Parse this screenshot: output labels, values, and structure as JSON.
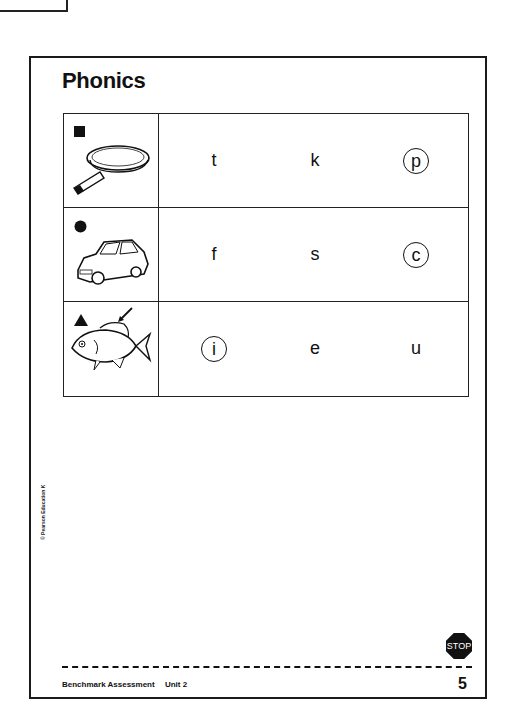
{
  "title": "Phonics",
  "rows": [
    {
      "marker": "square",
      "picture": "frying-pan",
      "choices": [
        {
          "letter": "t",
          "circled": false
        },
        {
          "letter": "k",
          "circled": false
        },
        {
          "letter": "p",
          "circled": true
        }
      ]
    },
    {
      "marker": "circle",
      "picture": "car",
      "choices": [
        {
          "letter": "f",
          "circled": false
        },
        {
          "letter": "s",
          "circled": false
        },
        {
          "letter": "c",
          "circled": true
        }
      ]
    },
    {
      "marker": "triangle",
      "picture": "fish-with-arrow-to-fin",
      "choices": [
        {
          "letter": "i",
          "circled": true
        },
        {
          "letter": "e",
          "circled": false
        },
        {
          "letter": "u",
          "circled": false
        }
      ]
    }
  ],
  "copyright": "© Pearson Education K",
  "stop_sign": "STOP",
  "footer": {
    "book": "Benchmark Assessment",
    "unit": "Unit 2",
    "page_number": "5"
  }
}
